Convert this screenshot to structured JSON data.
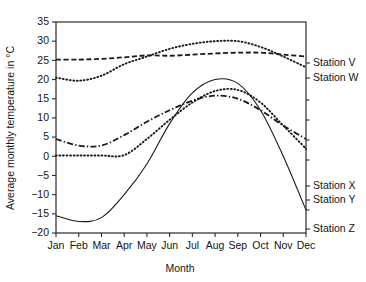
{
  "chart_data": {
    "type": "line",
    "title": "",
    "xlabel": "Month",
    "ylabel": "Average monthly temperature in °C",
    "categories": [
      "Jan",
      "Feb",
      "Mar",
      "Apr",
      "May",
      "Jun",
      "Jul",
      "Aug",
      "Sep",
      "Oct",
      "Nov",
      "Dec"
    ],
    "xtick_labels": [
      "Jan",
      "Feb",
      "Mar",
      "Apr",
      "May",
      "Jun",
      "Jul",
      "Aug",
      "Sep",
      "Oct",
      "Nov",
      "Dec"
    ],
    "ytick_labels": [
      "35",
      "30",
      "25",
      "20",
      "15",
      "10",
      "5",
      "0",
      "−5",
      "−10",
      "−15",
      "−20"
    ],
    "ytick_values": [
      35,
      30,
      25,
      20,
      15,
      10,
      5,
      0,
      -5,
      -10,
      -15,
      -20
    ],
    "ylim": [
      -20,
      35
    ],
    "grid": false,
    "legend_position": "right-inline",
    "series": [
      {
        "name": "Station V",
        "style": "dotted",
        "label": "Station V",
        "values": [
          20.5,
          19.7,
          21.0,
          24.0,
          26.0,
          28.0,
          29.3,
          30.0,
          30.0,
          28.5,
          26.0,
          23.2
        ]
      },
      {
        "name": "Station W",
        "style": "dashed",
        "label": "Station W",
        "values": [
          25.2,
          25.2,
          25.4,
          25.8,
          26.3,
          26.2,
          26.5,
          26.8,
          27.0,
          27.0,
          26.5,
          26.0
        ]
      },
      {
        "name": "Station X",
        "style": "dash-dot",
        "label": "Station X",
        "values": [
          4.5,
          2.8,
          2.8,
          5.5,
          9.0,
          12.0,
          14.5,
          15.8,
          15.0,
          12.0,
          8.0,
          4.5
        ]
      },
      {
        "name": "Station Y",
        "style": "dotted",
        "label": "Station Y",
        "values": [
          0.2,
          0.2,
          0.2,
          0.3,
          4.5,
          9.5,
          14.0,
          17.0,
          17.3,
          14.0,
          8.0,
          2.0
        ]
      },
      {
        "name": "Station Z",
        "style": "solid",
        "label": "Station Z",
        "values": [
          -15.5,
          -17.0,
          -16.0,
          -10.0,
          -2.0,
          8.5,
          16.5,
          20.0,
          19.0,
          12.0,
          0.0,
          -14.0
        ]
      }
    ]
  },
  "axis": {
    "x_title": "Month",
    "y_title": "Average monthly temperature in °C"
  }
}
